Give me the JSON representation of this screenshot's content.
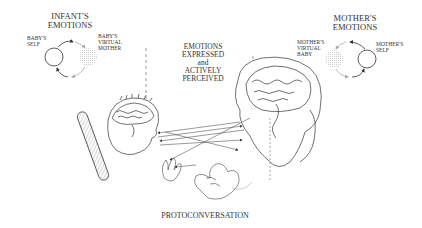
{
  "infant": {
    "title_line1": "INFANT'S",
    "title_line2": "EMOTIONS",
    "self_line1": "BABY'S",
    "self_line2": "SELF",
    "virtual_line1": "BABY'S",
    "virtual_line2": "VIRTUAL",
    "virtual_line3": "MOTHER"
  },
  "mother": {
    "title_line1": "MOTHER'S",
    "title_line2": "EMOTIONS",
    "virtual_line1": "MOTHER'S",
    "virtual_line2": "VIRTUAL",
    "virtual_line3": "BABY",
    "self_line1": "MOTHER'S",
    "self_line2": "SELF"
  },
  "center": {
    "line1": "EMOTIONS",
    "line2": "EXPRESSED",
    "line3": "and",
    "line4": "ACTIVELY",
    "line5": "PERCEIVED"
  },
  "caption": "PROTOCONVERSATION"
}
